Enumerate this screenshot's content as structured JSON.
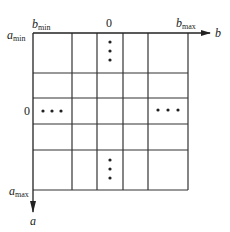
{
  "diagram": {
    "type": "grid",
    "axes": {
      "horizontal": {
        "label": "b",
        "min_label": "b",
        "min_sub": "min",
        "max_label": "b",
        "max_sub": "max",
        "center_label": "0"
      },
      "vertical": {
        "label": "a",
        "min_label": "a",
        "min_sub": "min",
        "max_label": "a",
        "max_sub": "max",
        "center_label": "0"
      }
    },
    "grid": {
      "columns_x": [
        33,
        72,
        97,
        123,
        148,
        188
      ],
      "rows_y": [
        33,
        73,
        98,
        124,
        150,
        190
      ],
      "line_color": "#333333"
    },
    "ellipses": [
      {
        "id": "top-center",
        "orientation": "vertical",
        "glyph": "⋮"
      },
      {
        "id": "bottom-center",
        "orientation": "vertical",
        "glyph": "⋮"
      },
      {
        "id": "left-middle",
        "orientation": "horizontal",
        "glyph": "⋯"
      },
      {
        "id": "right-middle",
        "orientation": "horizontal",
        "glyph": "⋯"
      }
    ]
  }
}
